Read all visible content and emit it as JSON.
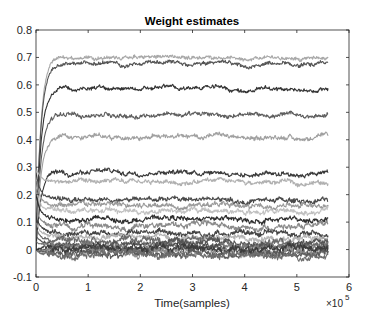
{
  "chart_data": {
    "type": "line",
    "title": "Weight estimates",
    "xlabel": "Time(samples)",
    "ylabel": "",
    "x_exponent_label": "×10",
    "x_exponent_power": "5",
    "xlim": [
      0,
      600000
    ],
    "ylim": [
      -0.1,
      0.8
    ],
    "x_ticks": [
      0,
      1,
      2,
      3,
      4,
      5,
      6
    ],
    "x_tick_labels": [
      "0",
      "1",
      "2",
      "3",
      "4",
      "5",
      "6"
    ],
    "y_ticks": [
      -0.1,
      0,
      0.1,
      0.2,
      0.3,
      0.4,
      0.5,
      0.6,
      0.7,
      0.8
    ],
    "y_tick_labels": [
      "-0.1",
      "0",
      "0.1",
      "0.2",
      "0.3",
      "0.4",
      "0.5",
      "0.6",
      "0.7",
      "0.8"
    ],
    "grid": false,
    "legend": null,
    "x_data_end": 560000,
    "series": [
      {
        "name": "w1",
        "start": 0.0,
        "level": 0.7,
        "color": "#a8a8a8",
        "noise": 0.006
      },
      {
        "name": "w2",
        "start": 0.0,
        "level": 0.675,
        "color": "#555555",
        "noise": 0.006
      },
      {
        "name": "w3",
        "start": 0.0,
        "level": 0.585,
        "color": "#333333",
        "noise": 0.006
      },
      {
        "name": "w4",
        "start": 0.0,
        "level": 0.49,
        "color": "#5e5e5e",
        "noise": 0.007
      },
      {
        "name": "w5",
        "start": 0.0,
        "level": 0.41,
        "color": "#a0a0a0",
        "noise": 0.007
      },
      {
        "name": "w6",
        "start": 0.0,
        "level": 0.28,
        "color": "#3a3a3a",
        "noise": 0.007
      },
      {
        "name": "w7",
        "start": 0.3,
        "level": 0.245,
        "color": "#b0b0b0",
        "noise": 0.007
      },
      {
        "name": "w8",
        "start": 0.28,
        "level": 0.18,
        "color": "#4a4a4a",
        "noise": 0.008
      },
      {
        "name": "w9",
        "start": 0.25,
        "level": 0.16,
        "color": "#9a9a9a",
        "noise": 0.008
      },
      {
        "name": "w10",
        "start": 0.22,
        "level": 0.14,
        "color": "#c0c0c0",
        "noise": 0.008
      },
      {
        "name": "w11",
        "start": 0.2,
        "level": 0.11,
        "color": "#2e2e2e",
        "noise": 0.008
      },
      {
        "name": "w12",
        "start": 0.15,
        "level": 0.085,
        "color": "#8a8a8a",
        "noise": 0.009
      },
      {
        "name": "w13",
        "start": 0.12,
        "level": 0.06,
        "color": "#444444",
        "noise": 0.009
      },
      {
        "name": "w14",
        "start": 0.1,
        "level": 0.045,
        "color": "#b5b5b5",
        "noise": 0.009
      },
      {
        "name": "w15",
        "start": 0.08,
        "level": 0.03,
        "color": "#6a6a6a",
        "noise": 0.01
      },
      {
        "name": "w16",
        "start": 0.05,
        "level": 0.02,
        "color": "#555555",
        "noise": 0.01
      },
      {
        "name": "w17",
        "start": 0.03,
        "level": 0.01,
        "color": "#7a7a7a",
        "noise": 0.01
      },
      {
        "name": "w18",
        "start": 0.0,
        "level": 0.0,
        "color": "#4f4f4f",
        "noise": 0.011
      },
      {
        "name": "w19",
        "start": 0.0,
        "level": -0.008,
        "color": "#8c8c8c",
        "noise": 0.011
      },
      {
        "name": "w20",
        "start": 0.0,
        "level": -0.015,
        "color": "#5a5a5a",
        "noise": 0.011
      },
      {
        "name": "w21",
        "start": 0.0,
        "level": 0.005,
        "color": "#3c3c3c",
        "noise": 0.011
      },
      {
        "name": "w22",
        "start": 0.0,
        "level": -0.02,
        "color": "#6e6e6e",
        "noise": 0.01
      }
    ]
  }
}
